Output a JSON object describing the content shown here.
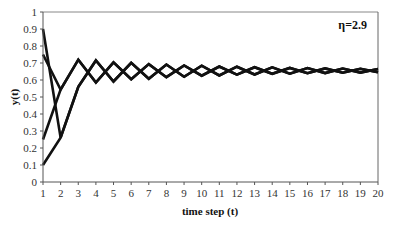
{
  "chart_data": {
    "type": "line",
    "title": "",
    "xlabel": "time step (t)",
    "ylabel": "y(t)",
    "annotation": "η=2.9",
    "annotation_position": "top-right",
    "x": [
      1,
      2,
      3,
      4,
      5,
      6,
      7,
      8,
      9,
      10,
      11,
      12,
      13,
      14,
      15,
      16,
      17,
      18,
      19,
      20
    ],
    "xlim": [
      1,
      20
    ],
    "ylim": [
      0,
      1
    ],
    "xticks": [
      "1",
      "2",
      "3",
      "4",
      "5",
      "6",
      "7",
      "8",
      "9",
      "10",
      "11",
      "12",
      "13",
      "14",
      "15",
      "16",
      "17",
      "18",
      "19",
      "20"
    ],
    "yticks": [
      "0",
      "0.1",
      "0.2",
      "0.3",
      "0.4",
      "0.5",
      "0.6",
      "0.7",
      "0.8",
      "0.9",
      "1"
    ],
    "grid": false,
    "legend": "none",
    "series": [
      {
        "name": "y0=0.9",
        "values": [
          0.9,
          0.261,
          0.5593,
          0.7148,
          0.5912,
          0.7009,
          0.6079,
          0.6911,
          0.6191,
          0.6842,
          0.6266,
          0.6785,
          0.6325,
          0.6741,
          0.6371,
          0.6705,
          0.6407,
          0.6676,
          0.6435,
          0.6653
        ]
      },
      {
        "name": "y0=0.75",
        "values": [
          0.75,
          0.5438,
          0.7194,
          0.5854,
          0.7038,
          0.6045,
          0.6933,
          0.6166,
          0.6855,
          0.6252,
          0.6796,
          0.6314,
          0.675,
          0.6362,
          0.6712,
          0.64,
          0.6682,
          0.643,
          0.6657,
          0.6454
        ]
      },
      {
        "name": "y0=0.25",
        "values": [
          0.25,
          0.5438,
          0.7194,
          0.5854,
          0.7038,
          0.6045,
          0.6933,
          0.6166,
          0.6855,
          0.6252,
          0.6796,
          0.6314,
          0.675,
          0.6362,
          0.6712,
          0.64,
          0.6682,
          0.643,
          0.6657,
          0.6454
        ]
      },
      {
        "name": "y0=0.1",
        "values": [
          0.1,
          0.261,
          0.5593,
          0.7148,
          0.5912,
          0.7009,
          0.6079,
          0.6911,
          0.6191,
          0.6842,
          0.6266,
          0.6785,
          0.6325,
          0.6741,
          0.6371,
          0.6705,
          0.6407,
          0.6676,
          0.6435,
          0.6653
        ]
      }
    ],
    "colors": {
      "line": "#111111",
      "axis": "#555555",
      "frame": "#777777"
    }
  }
}
